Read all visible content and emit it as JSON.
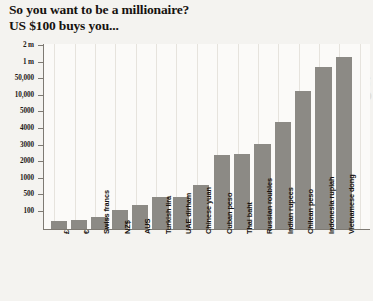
{
  "title": {
    "line1": "So you want to be a millionaire?",
    "line2": "US $100 buys you..."
  },
  "watermark": "Ouil Lif.g",
  "chart_data": {
    "type": "bar",
    "title": "So you want to be a millionaire? US $100 buys you...",
    "xlabel": "",
    "ylabel": "",
    "grid": "vertical",
    "legend": "none",
    "axis_scale": "piecewise (evenly spaced ticks)",
    "ytick_labels": [
      "100",
      "500",
      "1000",
      "2000",
      "3000",
      "4000",
      "5000",
      "10,000",
      "50,000",
      "1 m",
      "2 m"
    ],
    "ytick_values": [
      100,
      500,
      1000,
      2000,
      3000,
      4000,
      5000,
      10000,
      50000,
      1000000,
      2000000
    ],
    "categories": [
      "£",
      "€",
      "Swiss francs",
      "NZ$",
      "AUS",
      "Turkish lira",
      "UAE dirham",
      "Chinese yuan",
      "Cuban peso",
      "Thai baht",
      "Russian roubles",
      "Indian rupees",
      "Chilean peso",
      "Indonesia rupiah",
      "Vietnamese dong"
    ],
    "values": [
      78,
      92,
      99,
      150,
      185,
      370,
      370,
      660,
      2500,
      2600,
      3500,
      6300,
      66000,
      1400000,
      1900000
    ],
    "value_labels": [
      "78",
      "92",
      "99",
      "150",
      "185",
      "370",
      "370",
      "660",
      "2500",
      "2600",
      "3500",
      "6300",
      "66,000",
      "1.4 m",
      "1.9 m"
    ],
    "bar_color": "#8c8a85",
    "plot_background": "#fbfaf8",
    "page_background": "#f4f3f0"
  },
  "bars": [
    {
      "label": "£",
      "top": 177.0
    },
    {
      "label": "€",
      "top": 176.0
    },
    {
      "label": "Swiss francs",
      "top": 173.0
    },
    {
      "label": "NZ$",
      "top": 166.0
    },
    {
      "label": "AUS",
      "top": 161.0
    },
    {
      "label": "Turkish lira",
      "top": 152.5
    },
    {
      "label": "UAE dirham",
      "top": 152.5
    },
    {
      "label": "Chinese yuan",
      "top": 141.0
    },
    {
      "label": "Cuban peso",
      "top": 110.5
    },
    {
      "label": "Thai baht",
      "top": 109.5
    },
    {
      "label": "Russian roubles",
      "top": 100.0
    },
    {
      "label": "Indian rupees",
      "top": 78.0
    },
    {
      "label": "Chilean peso",
      "top": 47.0
    },
    {
      "label": "Indonesia rupiah",
      "top": 23.0
    },
    {
      "label": "Vietnamese dong",
      "top": 13.0
    }
  ]
}
